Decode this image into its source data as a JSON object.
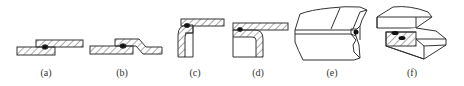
{
  "diagram": {
    "colors": {
      "line": "#333333",
      "hatch": "#555555",
      "weld": "#111111",
      "background": "#ffffff"
    },
    "figures": [
      {
        "id": "a",
        "label": "(a)",
        "kind": "plain lap joint, cross-section",
        "label_x": 46
      },
      {
        "id": "b",
        "label": "(b)",
        "kind": "joggled lap joint, cross-section",
        "label_x": 122
      },
      {
        "id": "c",
        "label": "(c)",
        "kind": "flanged corner lap joint, cross-section",
        "label_x": 195
      },
      {
        "id": "d",
        "label": "(d)",
        "kind": "inverted flange lap joint, cross-section",
        "label_x": 258
      },
      {
        "id": "e",
        "label": "(e)",
        "kind": "joggled lap joint, isometric",
        "label_x": 332
      },
      {
        "id": "f",
        "label": "(f)",
        "kind": "plain lap joint, isometric",
        "label_x": 412
      }
    ]
  }
}
